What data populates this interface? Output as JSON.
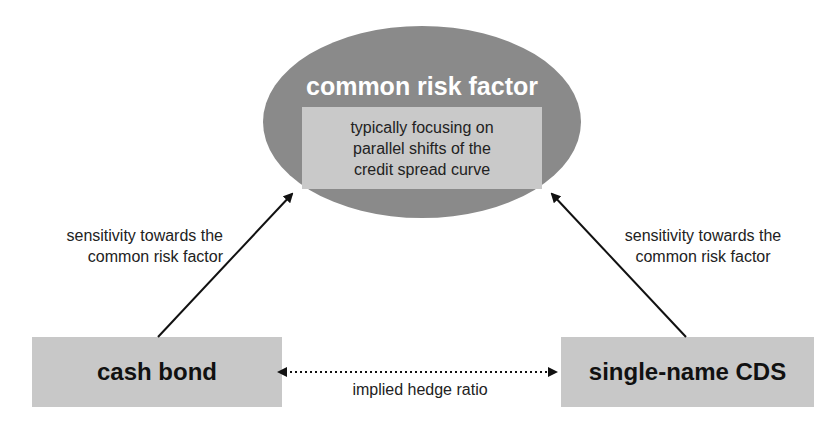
{
  "diagram": {
    "center_node": {
      "title": "common risk factor",
      "description_lines": [
        "typically focusing on",
        "parallel shifts of the",
        "credit spread curve"
      ]
    },
    "left_node": {
      "label": "cash bond"
    },
    "right_node": {
      "label": "single-name CDS"
    },
    "left_edge_label_lines": [
      "sensitivity towards the",
      "common risk factor"
    ],
    "right_edge_label_lines": [
      "sensitivity towards the",
      "common risk factor"
    ],
    "bottom_edge_label": "implied hedge ratio",
    "colors": {
      "ellipse_fill": "#8a8a8a",
      "inner_box_fill": "#c9c9c9",
      "node_box_fill": "#c8c8c8",
      "arrow": "#111111"
    }
  }
}
